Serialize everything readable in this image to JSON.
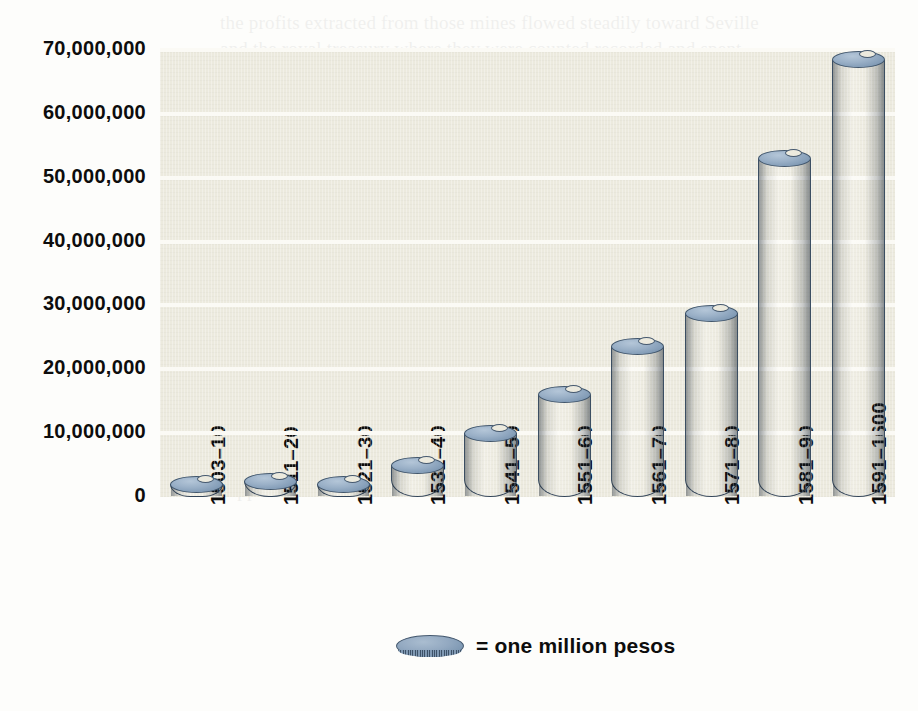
{
  "chart_data": {
    "type": "bar",
    "title": "",
    "subtitle": "",
    "xlabel": "",
    "ylabel": "",
    "categories": [
      "1503–10",
      "1511–20",
      "1521–30",
      "1531–40",
      "1541–50",
      "1551–60",
      "1561–70",
      "1571–80",
      "1581–90",
      "1591–1600"
    ],
    "values": [
      2000000,
      2500000,
      2000000,
      5000000,
      10000000,
      16000000,
      23500000,
      28800000,
      53000000,
      68500000
    ],
    "ylim": [
      0,
      70000000
    ],
    "ytick_values": [
      0,
      10000000,
      20000000,
      30000000,
      40000000,
      50000000,
      60000000,
      70000000
    ],
    "ytick_labels": [
      "0",
      "10,000,000",
      "20,000,000",
      "30,000,000",
      "40,000,000",
      "50,000,000",
      "60,000,000",
      "70,000,000"
    ],
    "grid": true,
    "legend_position": "bottom-center",
    "legend": [
      {
        "label": "= one million pesos",
        "marker": "coin-disc"
      }
    ],
    "unit_note": "= one million pesos",
    "bar_style": "stacked-coins-cylinder"
  },
  "colors": {
    "plot_background": "#eceade",
    "page_background": "#fdfdfb",
    "gridline": "#fbfaf5",
    "coin_top": "#9ab0c7",
    "coin_edge_light": "#8ba4bd",
    "coin_edge_dark": "#41556b",
    "axis_text": "#0d0d0d"
  },
  "legend": {
    "marker_name": "coin-disc",
    "text": "= one million pesos"
  },
  "ghost_text": "the profits extracted from those mines flowed steadily toward Seville and the royal treasury where they were counted recorded and spent. Within a single generation the volume of silver arriving from the Indies had multiplied many times over, and Europe as a whole began to feel the consequences of that sudden abundance. Prices rose across the continent, bullion moved outward through Genoa and Antwerp toward Amsterdam and the Levant, and Spain found itself simultaneously the richest and the most indebted of the great powers. Contemporaries were not blind to the paradox: pamphleteers in Valladolid and Madrid complained that the treasure of the Indies passed through Spain as rain passes through a roof, and that what remained behind was little more than the memory of having been wealthy. The arbitristas who wrote in the closing decades of the sixteenth century returned again and again to this theme, arguing that the inflow of precious metal had discouraged manufacture, inflated the cost of labour, and tied the monarchy to a cycle of borrowing against fleets that had not yet arrived. Whether or not their diagnosis was correct in every particular, the broad outline of the figures supports their unease."
}
